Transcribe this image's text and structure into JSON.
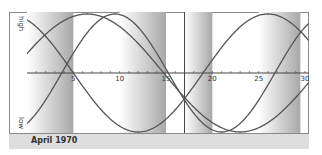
{
  "chart_data": {
    "type": "line",
    "title": "April 1970",
    "xlabel": "",
    "ylabel": "",
    "y_axis_labels": {
      "top": "high",
      "bottom": "low"
    },
    "xlim": [
      0,
      30
    ],
    "ylim": [
      -1,
      1
    ],
    "x_tick_labels": [
      "5",
      "10",
      "15",
      "20",
      "25",
      "30"
    ],
    "x_ticks": [
      5,
      10,
      15,
      20,
      25,
      30
    ],
    "minor_ticks_every": 1,
    "grid": false,
    "marker_line_day": 17,
    "series": [
      {
        "name": "cycle-23",
        "period": 23,
        "phase_peak_day": 9.5
      },
      {
        "name": "cycle-28",
        "period": 28,
        "phase_peak_day": 26
      },
      {
        "name": "cycle-33",
        "period": 33,
        "phase_peak_day": 6.5
      }
    ],
    "shaded_bands": [
      {
        "from": 0,
        "to": 5
      },
      {
        "from": 10,
        "to": 15
      },
      {
        "from": 17,
        "to": 20
      },
      {
        "from": 25,
        "to": 29.5
      }
    ]
  },
  "footer": {
    "label": "April 1970"
  },
  "axis": {
    "high": "high",
    "low": "low"
  },
  "colors": {
    "curve": "#555555",
    "axis": "#444444",
    "band_dark": "#a8a8a8",
    "band_light": "#ffffff",
    "frame": "#8a8a8a",
    "footer_bg": "#dedede"
  }
}
